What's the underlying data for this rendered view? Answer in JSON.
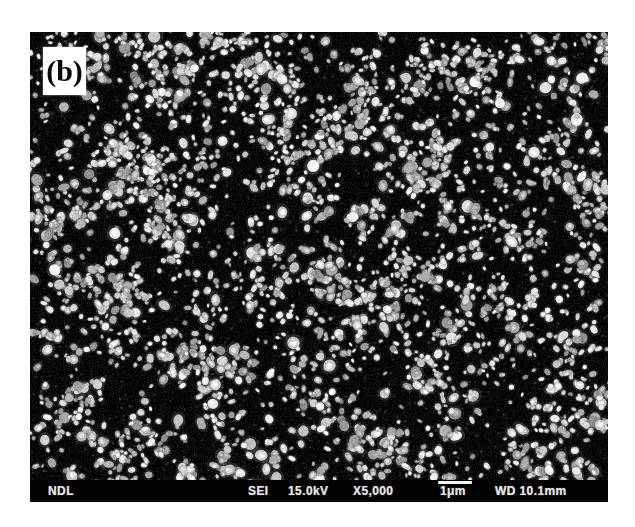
{
  "figure": {
    "panel_label": "(b)"
  },
  "info_bar": {
    "lab": "NDL",
    "detector": "SEI",
    "voltage": "15.0kV",
    "magnification": "X5,000",
    "scale_label": "1μm",
    "working_distance": "WD 10.1mm"
  },
  "colors": {
    "page_background": "#ffffff",
    "micrograph_background": "#0a0a0a",
    "info_bar_background": "#020202",
    "info_bar_text": "#e6e6e6",
    "scale_bar": "#f2f2f2",
    "panel_label_box": "#ffffff",
    "panel_label_text": "#0a0a0a"
  },
  "texture": {
    "seed": 1337,
    "width": 578,
    "height": 470,
    "background": "#070707",
    "cluster_count": 250,
    "cluster_spread": 24,
    "clustered_fraction": 0.7,
    "grain_count": 3200,
    "grain_min_radius": 2.0,
    "grain_max_radius": 6.8,
    "grain_gray_min": 148,
    "grain_gray_max": 255,
    "halo_alpha": 0.32,
    "noise_amplitude": 16
  }
}
